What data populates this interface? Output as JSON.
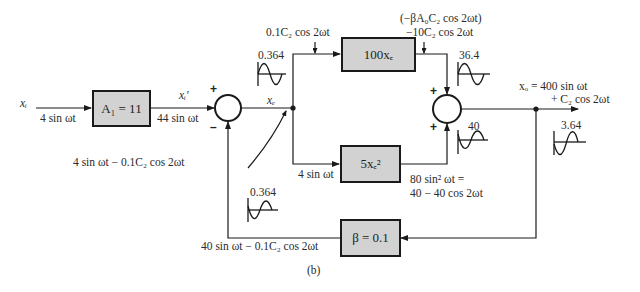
{
  "figure_label": "(b)",
  "blocks": {
    "amp1": "A₁ = 11",
    "forward_linear": "100xₑ",
    "forward_nonlinear": "5xₑ²",
    "feedback": "β = 0.1"
  },
  "signals": {
    "input_name": "xᵢ",
    "input_value": "4 sin ωt",
    "amp_out_name": "xᵢ′",
    "amp_out_value": "44 sin ωt",
    "error_name": "xₑ",
    "error_value": "4 sin ωt − 0.1C₂ cos 2ωt",
    "branch_lower_value": "4 sin ωt",
    "inject_upper": "0.1C₂ cos 2ωt",
    "inject_right_line1": "(−βA₀C₂ cos 2ωt)",
    "inject_right_line2": "−10C₂ cos 2ωt",
    "nonlinear_out_line1": "80 sin² ωt =",
    "nonlinear_out_line2": "40 − 40 cos 2ωt",
    "output_line1": "xₒ = 400 sin ωt",
    "output_line2": "+ C₂ cos 2ωt",
    "feedback_value": "40 sin ωt − 0.1C₂ cos 2ωt"
  },
  "waveforms": {
    "error": "0.364",
    "upper_sum_in": "36.4",
    "lower_sum_in": "40",
    "output": "3.64",
    "feedback": "0.364"
  },
  "signs": {
    "sum1_plus": "+",
    "sum1_minus": "–",
    "sum2_top": "+",
    "sum2_bottom": "+"
  }
}
